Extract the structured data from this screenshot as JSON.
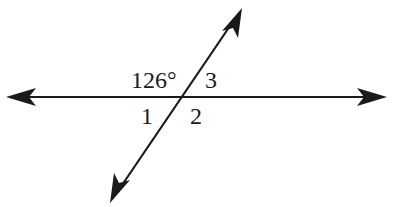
{
  "diagram": {
    "type": "intersecting-lines",
    "intersection": {
      "x": 181,
      "y": 97
    },
    "lines": [
      {
        "name": "horizontal-line",
        "from": {
          "x": 6,
          "y": 97
        },
        "to": {
          "x": 387,
          "y": 97
        },
        "arrows": "both"
      },
      {
        "name": "transversal-line",
        "from": {
          "x": 110,
          "y": 203
        },
        "to": {
          "x": 242,
          "y": 8
        },
        "arrows": "both"
      }
    ],
    "labels": {
      "given_angle": "126°",
      "angle_1": "1",
      "angle_2": "2",
      "angle_3": "3"
    },
    "colors": {
      "stroke": "#1a1a1a",
      "background": "#ffffff"
    }
  }
}
